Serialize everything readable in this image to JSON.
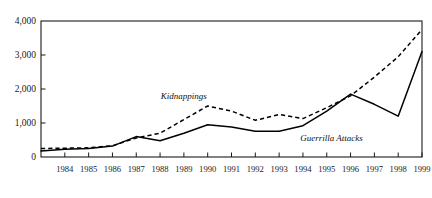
{
  "chart_data": {
    "type": "line",
    "title": "",
    "subtitle": "",
    "xlabel": "",
    "ylabel": "",
    "xlim": [
      1983,
      1999
    ],
    "ylim": [
      0,
      4000
    ],
    "grid": false,
    "legend_position": "inline-annotation",
    "x": [
      1983,
      1984,
      1985,
      1986,
      1987,
      1988,
      1989,
      1990,
      1991,
      1992,
      1993,
      1994,
      1995,
      1996,
      1997,
      1998,
      1999
    ],
    "x_tick_labels": [
      "",
      "1984",
      "1985",
      "1986",
      "1987",
      "1988",
      "1989",
      "1990",
      "1991",
      "1992",
      "1993",
      "1994",
      "1995",
      "1996",
      "1997",
      "1998",
      "1999"
    ],
    "y_tick_values": [
      0,
      1000,
      2000,
      3000,
      4000
    ],
    "y_tick_labels": [
      "0",
      "1,000",
      "2,000",
      "3,000",
      "4,000"
    ],
    "series": [
      {
        "name": "Kidnappings",
        "style": "dashed",
        "color": "#000000",
        "values": [
          250,
          260,
          270,
          330,
          560,
          700,
          1100,
          1500,
          1350,
          1080,
          1250,
          1130,
          1450,
          1800,
          2350,
          2950,
          3750
        ]
      },
      {
        "name": "Guerrilla Attacks",
        "style": "solid",
        "color": "#000000",
        "values": [
          180,
          230,
          250,
          320,
          600,
          480,
          700,
          950,
          880,
          760,
          760,
          920,
          1350,
          1850,
          1550,
          1200,
          3100
        ]
      }
    ],
    "annotations": [
      {
        "text": "Kidnappings",
        "x": 1989.0,
        "y": 1700,
        "style": "italic"
      },
      {
        "text": "Guerrilla Attacks",
        "x": 1995.2,
        "y": 460,
        "style": "italic"
      }
    ]
  },
  "axes": {
    "frame_color": "#1a1a1a",
    "background": "#ffffff"
  }
}
